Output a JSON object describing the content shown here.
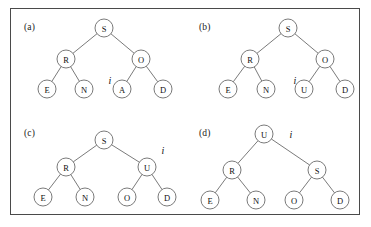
{
  "figure": {
    "border_color": "#4a4a4a",
    "background": "#ffffff",
    "node_stroke": "#6b6b6b",
    "text_color": "#111111",
    "node_radius": 9,
    "pointer_symbol": "i",
    "panels": [
      {
        "id": "a",
        "label": "(a)",
        "label_x": 14,
        "label_y": 14,
        "origin_x": 10,
        "origin_y": 8,
        "nodes": [
          {
            "key": "S",
            "x": 94,
            "y": 20
          },
          {
            "key": "R",
            "x": 56,
            "y": 51
          },
          {
            "key": "O",
            "x": 131,
            "y": 51
          },
          {
            "key": "E",
            "x": 37,
            "y": 81
          },
          {
            "key": "N",
            "x": 74,
            "y": 81
          },
          {
            "key": "A",
            "x": 112,
            "y": 81
          },
          {
            "key": "D",
            "x": 153,
            "y": 81
          }
        ],
        "edges": [
          {
            "from": "S",
            "to": "R"
          },
          {
            "from": "S",
            "to": "O"
          },
          {
            "from": "R",
            "to": "E"
          },
          {
            "from": "R",
            "to": "N"
          },
          {
            "from": "O",
            "to": "A"
          },
          {
            "from": "O",
            "to": "D"
          }
        ],
        "pointer": {
          "x": 100,
          "y": 72
        }
      },
      {
        "id": "b",
        "label": "(b)",
        "label_x": 14,
        "label_y": 14,
        "origin_x": 185,
        "origin_y": 8,
        "nodes": [
          {
            "key": "S",
            "x": 103,
            "y": 20
          },
          {
            "key": "R",
            "x": 65,
            "y": 51
          },
          {
            "key": "O",
            "x": 140,
            "y": 51
          },
          {
            "key": "E",
            "x": 43,
            "y": 81
          },
          {
            "key": "N",
            "x": 81,
            "y": 81
          },
          {
            "key": "U",
            "x": 119,
            "y": 81
          },
          {
            "key": "D",
            "x": 160,
            "y": 81
          }
        ],
        "edges": [
          {
            "from": "S",
            "to": "R"
          },
          {
            "from": "S",
            "to": "O"
          },
          {
            "from": "R",
            "to": "E"
          },
          {
            "from": "R",
            "to": "N"
          },
          {
            "from": "O",
            "to": "U"
          },
          {
            "from": "O",
            "to": "D"
          }
        ],
        "pointer": {
          "x": 110,
          "y": 72
        }
      },
      {
        "id": "c",
        "label": "(c)",
        "label_x": 14,
        "label_y": 13,
        "origin_x": 10,
        "origin_y": 115,
        "nodes": [
          {
            "key": "S",
            "x": 94,
            "y": 25
          },
          {
            "key": "R",
            "x": 56,
            "y": 52
          },
          {
            "key": "U",
            "x": 137,
            "y": 52
          },
          {
            "key": "E",
            "x": 33,
            "y": 82
          },
          {
            "key": "N",
            "x": 75,
            "y": 82
          },
          {
            "key": "O",
            "x": 117,
            "y": 82
          },
          {
            "key": "D",
            "x": 157,
            "y": 82
          }
        ],
        "edges": [
          {
            "from": "S",
            "to": "R"
          },
          {
            "from": "S",
            "to": "U"
          },
          {
            "from": "R",
            "to": "E"
          },
          {
            "from": "R",
            "to": "N"
          },
          {
            "from": "U",
            "to": "O"
          },
          {
            "from": "U",
            "to": "D"
          }
        ],
        "pointer": {
          "x": 153,
          "y": 35
        }
      },
      {
        "id": "d",
        "label": "(d)",
        "label_x": 14,
        "label_y": 13,
        "origin_x": 185,
        "origin_y": 115,
        "nodes": [
          {
            "key": "U",
            "x": 79,
            "y": 19
          },
          {
            "key": "R",
            "x": 47,
            "y": 55
          },
          {
            "key": "S",
            "x": 132,
            "y": 55
          },
          {
            "key": "E",
            "x": 25,
            "y": 85
          },
          {
            "key": "N",
            "x": 71,
            "y": 85
          },
          {
            "key": "O",
            "x": 109,
            "y": 85
          },
          {
            "key": "D",
            "x": 155,
            "y": 85
          }
        ],
        "edges": [
          {
            "from": "U",
            "to": "R"
          },
          {
            "from": "U",
            "to": "S"
          },
          {
            "from": "R",
            "to": "E"
          },
          {
            "from": "R",
            "to": "N"
          },
          {
            "from": "S",
            "to": "O"
          },
          {
            "from": "S",
            "to": "D"
          }
        ],
        "pointer": {
          "x": 106,
          "y": 19
        }
      }
    ]
  }
}
